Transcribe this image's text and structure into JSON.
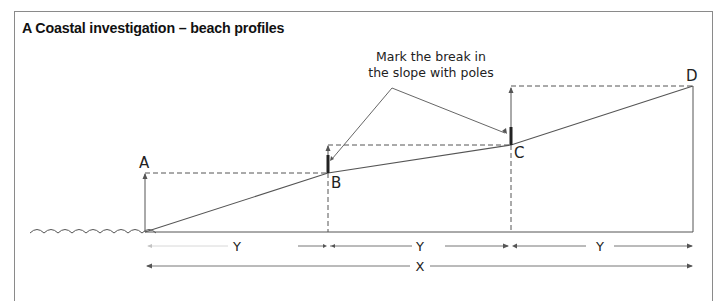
{
  "figure": {
    "title": "A  Coastal investigation – beach profiles",
    "annotation": {
      "line1": "Mark the break in",
      "line2": "the slope with poles"
    },
    "points": [
      {
        "label": "A"
      },
      {
        "label": "B"
      },
      {
        "label": "C"
      },
      {
        "label": "D"
      }
    ],
    "distances": {
      "segment_1": "Y",
      "segment_2": "Y",
      "segment_3": "Y",
      "total": "X"
    },
    "colors": {
      "line": "#555555",
      "pole": "#222222",
      "frame": "#8a8a8a"
    }
  }
}
